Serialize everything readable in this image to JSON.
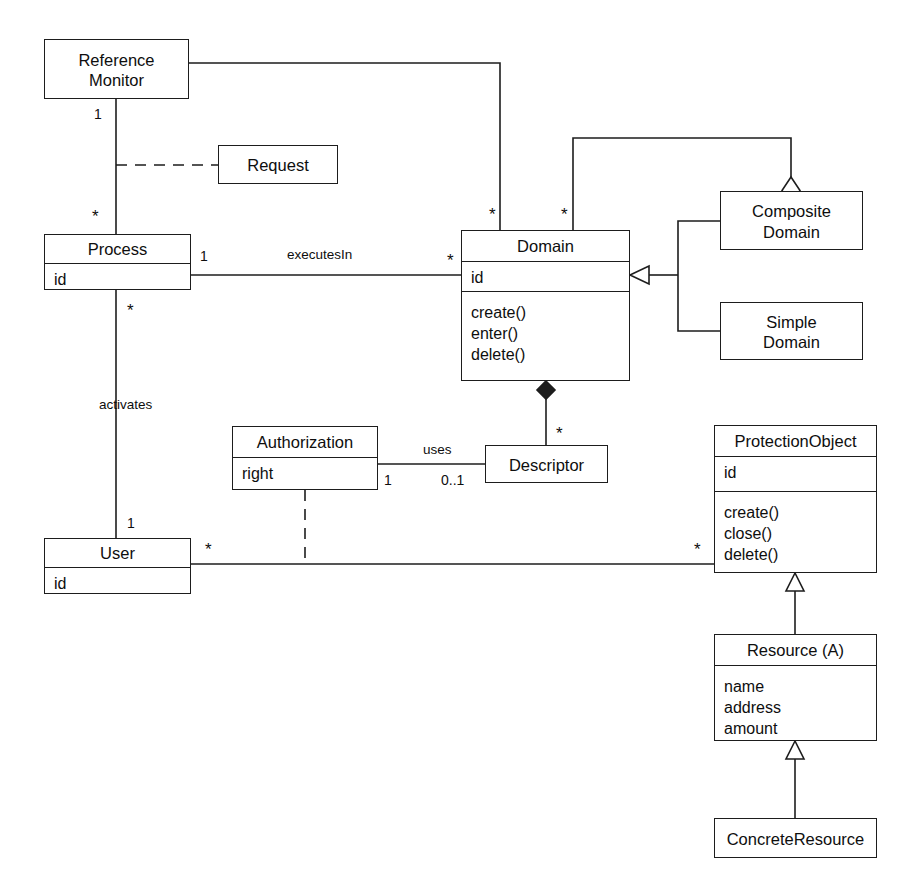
{
  "diagram": {
    "kind": "uml-class-diagram",
    "stroke_color": "#1d1d1d",
    "background_color": "#ffffff",
    "width": 914,
    "height": 871
  },
  "classes": [
    {
      "id": "reference-monitor",
      "name": "Reference\nMonitor",
      "attributes": [],
      "operations": [],
      "x": 44,
      "y": 39,
      "w": 145,
      "h": 60,
      "name_h": 60
    },
    {
      "id": "request",
      "name": "Request",
      "attributes": [],
      "operations": [],
      "x": 218,
      "y": 145,
      "w": 120,
      "h": 39,
      "name_h": 39
    },
    {
      "id": "process",
      "name": "Process",
      "attributes": [
        "id"
      ],
      "operations": [],
      "x": 44,
      "y": 234,
      "w": 147,
      "h": 56,
      "name_h": 28
    },
    {
      "id": "domain",
      "name": "Domain",
      "attributes": [
        "id"
      ],
      "operations": [
        "create()",
        "enter()",
        "delete()"
      ],
      "x": 461,
      "y": 230,
      "w": 169,
      "h": 151,
      "name_h": 30,
      "attr_h": 30
    },
    {
      "id": "composite-domain",
      "name": "Composite\nDomain",
      "attributes": [],
      "operations": [],
      "x": 720,
      "y": 191,
      "w": 143,
      "h": 59,
      "name_h": 59
    },
    {
      "id": "simple-domain",
      "name": "Simple\nDomain",
      "attributes": [],
      "operations": [],
      "x": 720,
      "y": 302,
      "w": 143,
      "h": 58,
      "name_h": 58
    },
    {
      "id": "authorization",
      "name": "Authorization",
      "attributes": [
        "right"
      ],
      "operations": [],
      "x": 232,
      "y": 426,
      "w": 146,
      "h": 64,
      "name_h": 30
    },
    {
      "id": "descriptor",
      "name": "Descriptor",
      "attributes": [],
      "operations": [],
      "x": 485,
      "y": 445,
      "w": 123,
      "h": 38,
      "name_h": 38
    },
    {
      "id": "protection-object",
      "name": "ProtectionObject",
      "attributes": [
        "id"
      ],
      "operations": [
        "create()",
        "close()",
        "delete()"
      ],
      "x": 714,
      "y": 425,
      "w": 163,
      "h": 148,
      "name_h": 30,
      "attr_h": 35
    },
    {
      "id": "user",
      "name": "User",
      "attributes": [
        "id"
      ],
      "operations": [],
      "x": 44,
      "y": 538,
      "w": 147,
      "h": 56,
      "name_h": 28
    },
    {
      "id": "resource",
      "name": "Resource (A)",
      "attributes": [
        "name",
        "address",
        "amount"
      ],
      "operations": [],
      "x": 714,
      "y": 634,
      "w": 163,
      "h": 107,
      "name_h": 30
    },
    {
      "id": "concrete-resource",
      "name": "ConcreteResource",
      "attributes": [],
      "operations": [],
      "x": 714,
      "y": 818,
      "w": 163,
      "h": 40,
      "name_h": 40
    }
  ],
  "edge_labels": [
    {
      "id": "executes-in",
      "text": "executesIn",
      "x": 287,
      "y": 247
    },
    {
      "id": "activates",
      "text": "activates",
      "x": 99,
      "y": 397
    },
    {
      "id": "uses",
      "text": "uses",
      "x": 423,
      "y": 442
    }
  ],
  "multiplicities": [
    {
      "id": "rm-process-one",
      "text": "1",
      "x": 94,
      "y": 106
    },
    {
      "id": "rm-process-many",
      "text": "*",
      "x": 92,
      "y": 207,
      "star": true
    },
    {
      "id": "process-domain-one",
      "text": "1",
      "x": 200,
      "y": 248
    },
    {
      "id": "process-domain-many",
      "text": "*",
      "x": 447,
      "y": 251,
      "star": true
    },
    {
      "id": "domain-top-left-many",
      "text": "*",
      "x": 489,
      "y": 205,
      "star": true
    },
    {
      "id": "domain-top-right-many",
      "text": "*",
      "x": 561,
      "y": 205,
      "star": true
    },
    {
      "id": "process-user-many",
      "text": "*",
      "x": 127,
      "y": 301,
      "star": true
    },
    {
      "id": "user-one",
      "text": "1",
      "x": 127,
      "y": 515
    },
    {
      "id": "authorization-one",
      "text": "1",
      "x": 384,
      "y": 472
    },
    {
      "id": "descriptor-zero-one",
      "text": "0..1",
      "x": 441,
      "y": 472
    },
    {
      "id": "descriptor-many",
      "text": "*",
      "x": 556,
      "y": 424,
      "star": true
    },
    {
      "id": "user-protection-many",
      "text": "*",
      "x": 205,
      "y": 540,
      "star": true
    },
    {
      "id": "protection-object-many",
      "text": "*",
      "x": 694,
      "y": 540,
      "star": true
    }
  ]
}
